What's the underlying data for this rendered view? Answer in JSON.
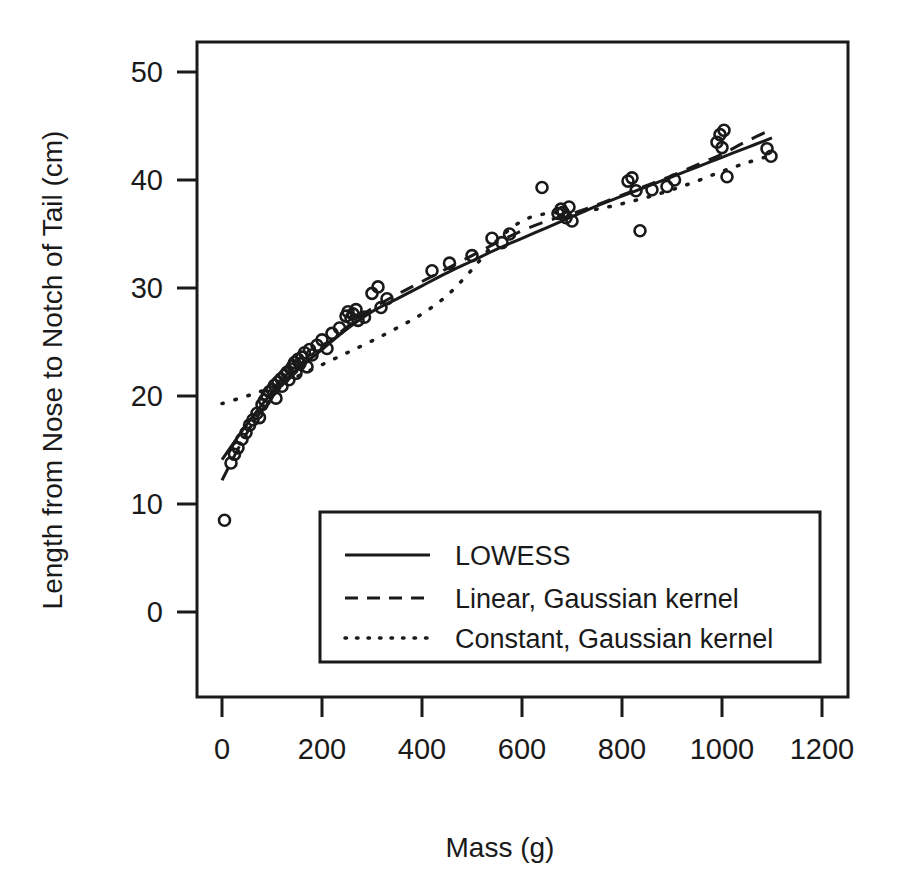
{
  "chart_data": {
    "type": "scatter",
    "title": "",
    "xlabel": "Mass (g)",
    "ylabel": "Length from Nose to Notch of Tail (cm)",
    "xlim": [
      0,
      1200
    ],
    "ylim": [
      0,
      52
    ],
    "xticks": [
      0,
      200,
      400,
      600,
      800,
      1000,
      1200
    ],
    "yticks": [
      0,
      10,
      20,
      30,
      40,
      50
    ],
    "xticklabels": [
      "0",
      "200",
      "400",
      "600",
      "800",
      "1000",
      "1200"
    ],
    "yticklabels": [
      "0",
      "10",
      "20",
      "30",
      "40",
      "50"
    ],
    "grid": false,
    "legend_position": "center",
    "marker": "open-circle",
    "points": [
      [
        5,
        8.5
      ],
      [
        18,
        13.8
      ],
      [
        25,
        14.6
      ],
      [
        32,
        15.2
      ],
      [
        40,
        16.0
      ],
      [
        48,
        16.6
      ],
      [
        55,
        17.3
      ],
      [
        62,
        17.8
      ],
      [
        70,
        18.4
      ],
      [
        75,
        18.0
      ],
      [
        80,
        19.2
      ],
      [
        85,
        19.6
      ],
      [
        90,
        20.0
      ],
      [
        95,
        20.4
      ],
      [
        100,
        20.6
      ],
      [
        105,
        21.0
      ],
      [
        108,
        19.8
      ],
      [
        112,
        21.3
      ],
      [
        118,
        21.6
      ],
      [
        120,
        20.9
      ],
      [
        125,
        21.9
      ],
      [
        130,
        22.2
      ],
      [
        134,
        21.5
      ],
      [
        138,
        22.5
      ],
      [
        142,
        22.8
      ],
      [
        145,
        23.1
      ],
      [
        148,
        22.1
      ],
      [
        152,
        23.4
      ],
      [
        156,
        23.0
      ],
      [
        160,
        23.6
      ],
      [
        165,
        24.0
      ],
      [
        170,
        22.7
      ],
      [
        175,
        24.3
      ],
      [
        180,
        23.8
      ],
      [
        190,
        24.7
      ],
      [
        200,
        25.2
      ],
      [
        210,
        24.4
      ],
      [
        220,
        25.8
      ],
      [
        235,
        26.3
      ],
      [
        248,
        27.4
      ],
      [
        252,
        27.8
      ],
      [
        258,
        27.2
      ],
      [
        262,
        27.6
      ],
      [
        268,
        28.0
      ],
      [
        272,
        27.0
      ],
      [
        285,
        27.3
      ],
      [
        300,
        29.5
      ],
      [
        312,
        30.1
      ],
      [
        318,
        28.2
      ],
      [
        330,
        29.0
      ],
      [
        420,
        31.6
      ],
      [
        455,
        32.3
      ],
      [
        500,
        33.0
      ],
      [
        540,
        34.6
      ],
      [
        560,
        34.2
      ],
      [
        575,
        35.0
      ],
      [
        640,
        39.3
      ],
      [
        672,
        36.9
      ],
      [
        678,
        37.3
      ],
      [
        682,
        37.0
      ],
      [
        688,
        36.5
      ],
      [
        694,
        37.5
      ],
      [
        700,
        36.2
      ],
      [
        812,
        39.9
      ],
      [
        820,
        40.2
      ],
      [
        828,
        39.0
      ],
      [
        836,
        35.3
      ],
      [
        860,
        39.1
      ],
      [
        890,
        39.4
      ],
      [
        905,
        40.0
      ],
      [
        990,
        43.5
      ],
      [
        996,
        44.2
      ],
      [
        1000,
        43.0
      ],
      [
        1004,
        44.6
      ],
      [
        1010,
        40.3
      ],
      [
        1090,
        42.9
      ],
      [
        1098,
        42.2
      ]
    ],
    "series": [
      {
        "name": "LOWESS",
        "style": "solid",
        "x": [
          0,
          50,
          100,
          150,
          200,
          250,
          300,
          350,
          400,
          450,
          500,
          550,
          600,
          650,
          700,
          750,
          800,
          850,
          900,
          950,
          1000,
          1050,
          1100
        ],
        "y": [
          14.1,
          17.4,
          20.3,
          22.4,
          24.3,
          26.2,
          27.8,
          29.0,
          30.2,
          31.4,
          32.5,
          33.6,
          34.6,
          35.6,
          36.6,
          37.6,
          38.5,
          39.4,
          40.3,
          41.2,
          42.1,
          43.0,
          43.9
        ]
      },
      {
        "name": "Linear, Gaussian kernel",
        "style": "dashed",
        "x": [
          0,
          50,
          100,
          150,
          200,
          250,
          300,
          350,
          400,
          450,
          500,
          550,
          600,
          650,
          700,
          750,
          800,
          850,
          900,
          950,
          1000,
          1050,
          1100
        ],
        "y": [
          12.2,
          16.6,
          19.9,
          22.3,
          24.4,
          26.4,
          28.1,
          29.4,
          30.6,
          31.8,
          33.0,
          34.2,
          35.3,
          36.2,
          36.9,
          37.7,
          38.6,
          39.5,
          40.4,
          41.4,
          42.4,
          43.6,
          44.7
        ]
      },
      {
        "name": "Constant, Gaussian kernel",
        "style": "dotted",
        "x": [
          0,
          50,
          100,
          150,
          200,
          250,
          300,
          350,
          400,
          450,
          500,
          550,
          600,
          650,
          700,
          750,
          800,
          850,
          900,
          950,
          1000,
          1050,
          1100
        ],
        "y": [
          19.3,
          20.0,
          20.8,
          21.8,
          22.9,
          24.0,
          25.1,
          26.3,
          27.6,
          29.3,
          31.7,
          34.4,
          36.2,
          36.9,
          37.0,
          37.3,
          37.8,
          38.4,
          39.1,
          39.9,
          40.8,
          41.6,
          42.3
        ]
      }
    ]
  },
  "legend": {
    "items": [
      {
        "label": "LOWESS",
        "style": "solid"
      },
      {
        "label": "Linear, Gaussian kernel",
        "style": "dashed"
      },
      {
        "label": "Constant, Gaussian kernel",
        "style": "dotted"
      }
    ]
  }
}
